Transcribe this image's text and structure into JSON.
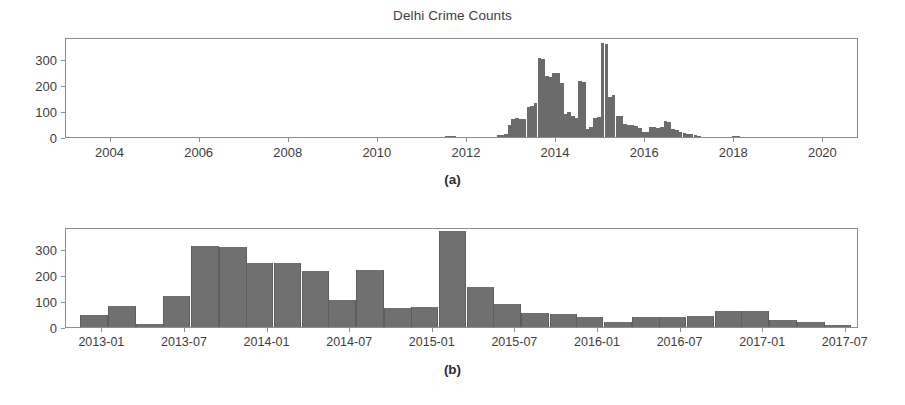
{
  "figure": {
    "title": "Delhi Crime Counts",
    "panel_a_letter": "(a)",
    "panel_b_letter": "(b)"
  },
  "chart_data": [
    {
      "id": "panel-a",
      "type": "bar",
      "title": "Delhi Crime Counts",
      "subtitle": "(a)",
      "xlabel": "",
      "ylabel": "",
      "grid": false,
      "legend": null,
      "xlim": [
        2003.0,
        2020.8
      ],
      "ylim": [
        0,
        385
      ],
      "xticks": [
        2004,
        2006,
        2008,
        2010,
        2012,
        2014,
        2016,
        2018,
        2020
      ],
      "xticklabels": [
        "2004",
        "2006",
        "2008",
        "2010",
        "2012",
        "2014",
        "2016",
        "2018",
        "2020"
      ],
      "yticks": [
        0,
        100,
        200,
        300
      ],
      "yticklabels": [
        "0",
        "100",
        "200",
        "300"
      ],
      "bin_width_years": 0.0833,
      "bars": [
        {
          "x": 2011.55,
          "value": 4
        },
        {
          "x": 2011.63,
          "value": 5
        },
        {
          "x": 2011.71,
          "value": 3
        },
        {
          "x": 2012.71,
          "value": 6
        },
        {
          "x": 2012.79,
          "value": 8
        },
        {
          "x": 2012.88,
          "value": 10
        },
        {
          "x": 2012.96,
          "value": 45
        },
        {
          "x": 2013.04,
          "value": 70
        },
        {
          "x": 2013.13,
          "value": 72
        },
        {
          "x": 2013.21,
          "value": 70
        },
        {
          "x": 2013.29,
          "value": 68
        },
        {
          "x": 2013.38,
          "value": 115
        },
        {
          "x": 2013.46,
          "value": 118
        },
        {
          "x": 2013.54,
          "value": 130
        },
        {
          "x": 2013.63,
          "value": 305
        },
        {
          "x": 2013.71,
          "value": 300
        },
        {
          "x": 2013.79,
          "value": 235
        },
        {
          "x": 2013.88,
          "value": 230
        },
        {
          "x": 2013.96,
          "value": 248
        },
        {
          "x": 2014.04,
          "value": 245
        },
        {
          "x": 2014.13,
          "value": 208
        },
        {
          "x": 2014.21,
          "value": 90
        },
        {
          "x": 2014.29,
          "value": 95
        },
        {
          "x": 2014.38,
          "value": 80
        },
        {
          "x": 2014.46,
          "value": 75
        },
        {
          "x": 2014.54,
          "value": 215
        },
        {
          "x": 2014.63,
          "value": 212
        },
        {
          "x": 2014.71,
          "value": 32
        },
        {
          "x": 2014.79,
          "value": 38
        },
        {
          "x": 2014.88,
          "value": 75
        },
        {
          "x": 2014.96,
          "value": 78
        },
        {
          "x": 2015.04,
          "value": 362
        },
        {
          "x": 2015.13,
          "value": 358
        },
        {
          "x": 2015.21,
          "value": 155
        },
        {
          "x": 2015.29,
          "value": 160
        },
        {
          "x": 2015.38,
          "value": 82
        },
        {
          "x": 2015.46,
          "value": 80
        },
        {
          "x": 2015.54,
          "value": 52
        },
        {
          "x": 2015.63,
          "value": 48
        },
        {
          "x": 2015.71,
          "value": 45
        },
        {
          "x": 2015.79,
          "value": 42
        },
        {
          "x": 2015.88,
          "value": 35
        },
        {
          "x": 2015.96,
          "value": 18
        },
        {
          "x": 2016.04,
          "value": 20
        },
        {
          "x": 2016.13,
          "value": 38
        },
        {
          "x": 2016.21,
          "value": 40
        },
        {
          "x": 2016.29,
          "value": 36
        },
        {
          "x": 2016.38,
          "value": 38
        },
        {
          "x": 2016.46,
          "value": 60
        },
        {
          "x": 2016.54,
          "value": 58
        },
        {
          "x": 2016.63,
          "value": 30
        },
        {
          "x": 2016.71,
          "value": 26
        },
        {
          "x": 2016.79,
          "value": 18
        },
        {
          "x": 2016.88,
          "value": 16
        },
        {
          "x": 2016.96,
          "value": 12
        },
        {
          "x": 2017.04,
          "value": 10
        },
        {
          "x": 2017.13,
          "value": 6
        },
        {
          "x": 2017.21,
          "value": 3
        },
        {
          "x": 2018.0,
          "value": 5
        },
        {
          "x": 2018.08,
          "value": 4
        }
      ]
    },
    {
      "id": "panel-b",
      "type": "bar",
      "title": "",
      "subtitle": "(b)",
      "xlabel": "",
      "ylabel": "",
      "grid": false,
      "legend": null,
      "xlim": [
        2012.78,
        2017.58
      ],
      "ylim": [
        0,
        385
      ],
      "xticks": [
        "2013-01",
        "2013-07",
        "2014-01",
        "2014-07",
        "2015-01",
        "2015-07",
        "2016-01",
        "2016-07",
        "2017-01",
        "2017-07"
      ],
      "xticklabels": [
        "2013-01",
        "2013-07",
        "2014-01",
        "2014-07",
        "2015-01",
        "2015-07",
        "2016-01",
        "2016-07",
        "2017-01",
        "2017-07"
      ],
      "yticks": [
        0,
        100,
        200,
        300
      ],
      "yticklabels": [
        "0",
        "100",
        "200",
        "300"
      ],
      "bin_width_years": 0.1667,
      "bars": [
        {
          "x": 2012.95,
          "value": 45
        },
        {
          "x": 2013.12,
          "value": 80
        },
        {
          "x": 2013.29,
          "value": 12
        },
        {
          "x": 2013.45,
          "value": 120
        },
        {
          "x": 2013.62,
          "value": 310
        },
        {
          "x": 2013.79,
          "value": 308
        },
        {
          "x": 2013.95,
          "value": 245
        },
        {
          "x": 2014.12,
          "value": 248
        },
        {
          "x": 2014.29,
          "value": 215
        },
        {
          "x": 2014.45,
          "value": 103
        },
        {
          "x": 2014.62,
          "value": 218
        },
        {
          "x": 2014.79,
          "value": 75
        },
        {
          "x": 2014.95,
          "value": 78
        },
        {
          "x": 2015.12,
          "value": 370
        },
        {
          "x": 2015.29,
          "value": 155
        },
        {
          "x": 2015.45,
          "value": 88
        },
        {
          "x": 2015.62,
          "value": 55
        },
        {
          "x": 2015.79,
          "value": 52
        },
        {
          "x": 2015.95,
          "value": 40
        },
        {
          "x": 2016.12,
          "value": 18
        },
        {
          "x": 2016.29,
          "value": 38
        },
        {
          "x": 2016.45,
          "value": 40
        },
        {
          "x": 2016.62,
          "value": 42
        },
        {
          "x": 2016.79,
          "value": 62
        },
        {
          "x": 2016.95,
          "value": 60
        },
        {
          "x": 2017.12,
          "value": 28
        },
        {
          "x": 2017.29,
          "value": 18
        },
        {
          "x": 2017.45,
          "value": 8
        }
      ]
    }
  ]
}
